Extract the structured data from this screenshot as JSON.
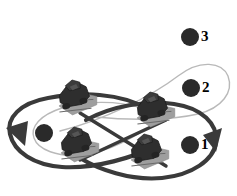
{
  "figure": {
    "background_color": "#ffffff",
    "width": 237,
    "height": 196
  },
  "colors": {
    "dark_path": "#3a3a3a",
    "light_path": "#b9b9b9",
    "marker_fill": "#2a2a2a",
    "robot_body": "#2e2e2e",
    "robot_shadow": "#9e9e9e",
    "robot_outline": "#1a1a1a",
    "text": "#000000"
  },
  "legend": {
    "items": [
      {
        "id": "marker-1",
        "label": "1",
        "marker": "filled-circle",
        "marker_color": "#2a2a2a",
        "cx": 190,
        "cy": 145,
        "r": 9
      },
      {
        "id": "marker-2",
        "label": "2",
        "marker": "filled-circle",
        "marker_color": "#2a2a2a",
        "cx": 191,
        "cy": 88,
        "r": 9
      },
      {
        "id": "marker-3",
        "label": "3",
        "marker": "filled-circle",
        "marker_color": "#2a2a2a",
        "cx": 190,
        "cy": 37,
        "r": 9
      }
    ]
  },
  "markers": {
    "left_center_dot": {
      "id": "marker-left-center",
      "cx": 44,
      "cy": 133,
      "r": 9,
      "color": "#2a2a2a"
    }
  },
  "paths": {
    "dark_loops": [
      {
        "id": "left-dark-loop",
        "description": "thick dark left loop of the figure-eight",
        "d": "M 150 110 C 120 92 80 92 48 98 C 20 103 6 118 10 134 C 14 152 34 165 62 167 C 96 169 134 157 156 146",
        "stroke": "#3a3a3a",
        "width": 4.2
      },
      {
        "id": "right-dark-loop",
        "description": "thick dark right loop of the figure-eight",
        "d": "M 86 120 C 112 106 146 100 174 104 C 202 108 218 124 216 142 C 214 160 192 175 162 178 C 130 181 98 169 80 158",
        "stroke": "#3a3a3a",
        "width": 4.2
      }
    ],
    "light_loops": [
      {
        "id": "left-light-loop",
        "description": "thin light-gray inner loop around the left dot",
        "d": "M 142 108 C 116 100 84 101 62 108 C 40 115 30 127 34 138 C 38 150 58 157 80 155 C 104 153 128 141 146 129",
        "stroke": "#b9b9b9",
        "width": 1.4
      },
      {
        "id": "right-light-loop",
        "description": "thin light-gray upper-right loop around marker 2",
        "d": "M 60 131 C 104 120 152 96 178 76 C 200 59 222 62 228 76 C 234 92 222 108 198 114 C 168 121 124 120 96 117",
        "stroke": "#b9b9b9",
        "width": 1.4
      }
    ],
    "crossing_lines": [
      {
        "id": "cross-line-a",
        "description": "dark diagonal link from upper-left robot to lower-right robot",
        "d": "M 80 113 L 166 166",
        "stroke": "#3a3a3a",
        "width": 3.4
      },
      {
        "id": "cross-line-b",
        "description": "dark diagonal link from lower-left robot to upper-right robot",
        "d": "M 80 160 L 166 120",
        "stroke": "#3a3a3a",
        "width": 3.4
      }
    ],
    "arrowheads": [
      {
        "id": "left-arrowhead",
        "description": "arrowhead on left dark loop pointing left",
        "points": "6,128 28,121 25,146",
        "fill": "#3a3a3a"
      },
      {
        "id": "right-arrowhead",
        "description": "arrowhead on right dark loop pointing up-right",
        "points": "222,128 216,152 203,135",
        "fill": "#3a3a3a"
      }
    ]
  },
  "robots": [
    {
      "id": "robot-upper-left",
      "name": "robot-1",
      "x": 74,
      "y": 96,
      "rotation": -14,
      "scale": 1.0
    },
    {
      "id": "robot-lower-left",
      "name": "robot-2",
      "x": 76,
      "y": 143,
      "rotation": -14,
      "scale": 1.0
    },
    {
      "id": "robot-upper-right",
      "name": "robot-3",
      "x": 152,
      "y": 108,
      "rotation": -14,
      "scale": 1.0
    },
    {
      "id": "robot-lower-right",
      "name": "robot-4",
      "x": 146,
      "y": 150,
      "rotation": -14,
      "scale": 1.0
    }
  ]
}
